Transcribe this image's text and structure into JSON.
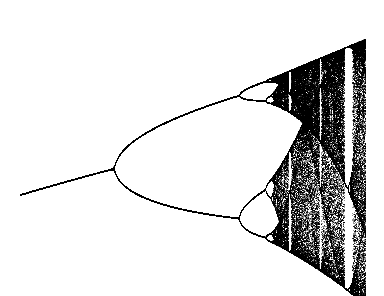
{
  "chart_data": {
    "type": "scatter",
    "title": "",
    "subtitle": "",
    "xlabel": "",
    "ylabel": "",
    "grid": false,
    "axes_visible": false,
    "legend": null,
    "r_range": [
      2.66,
      3.9
    ],
    "x_range": [
      0,
      1
    ],
    "point_color": "#1a1a1a",
    "background_color": "#ffffff",
    "features": {
      "first_bifurcation_r": 3.0,
      "second_bifurcation_r": 3.449,
      "onset_of_chaos_r": 3.57,
      "period3_window_r": 3.83,
      "visible_periodic_windows_r": [
        3.63,
        3.74,
        3.83
      ]
    },
    "annotations": []
  }
}
